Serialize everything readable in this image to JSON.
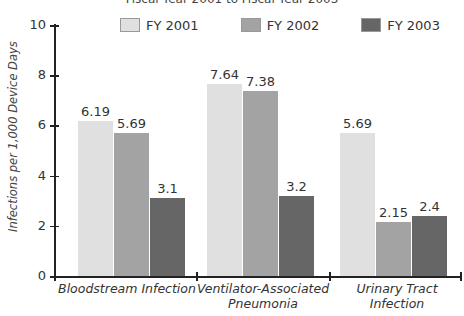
{
  "chart_data": {
    "type": "bar",
    "title": "Fiscal Year 2001 to Fiscal Year 2003",
    "xlabel": "",
    "ylabel": "Infections per 1,000 Device Days",
    "ylim": [
      0,
      10
    ],
    "yticks": [
      "0",
      "2",
      "4",
      "6",
      "8",
      "10"
    ],
    "categories": [
      "Bloodstream Infection",
      "Ventilator-Associated Pneumonia",
      "Urinary Tract Infection"
    ],
    "series": [
      {
        "name": "FY 2001",
        "color": "#e0e0e0",
        "values": [
          6.19,
          7.64,
          5.69
        ],
        "labels": [
          "6.19",
          "7.64",
          "5.69"
        ]
      },
      {
        "name": "FY 2002",
        "color": "#a3a3a3",
        "values": [
          5.69,
          7.38,
          2.15
        ],
        "labels": [
          "5.69",
          "7.38",
          "2.15"
        ]
      },
      {
        "name": "FY 2003",
        "color": "#666666",
        "values": [
          3.1,
          3.2,
          2.4
        ],
        "labels": [
          "3.1",
          "3.2",
          "2.4"
        ]
      }
    ],
    "legend_position": "top",
    "grid": false
  },
  "category_labels": {
    "c0": "Bloodstream Infection",
    "c1_line1": "Ventilator-Associated",
    "c1_line2": "Pneumonia",
    "c2": "Urinary Tract Infection"
  }
}
